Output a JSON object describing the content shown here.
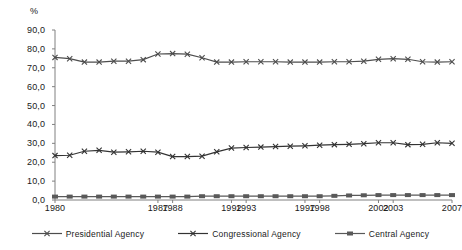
{
  "chart_data": {
    "type": "line",
    "title": "",
    "subtitle": "",
    "xlabel": "",
    "ylabel": "%",
    "ylim": [
      0,
      90
    ],
    "ytick_step": 10,
    "ytick_labels": [
      "0,0",
      "10,0",
      "20,0",
      "30,0",
      "40,0",
      "50,0",
      "60,0",
      "70,0",
      "80,0",
      "90,0"
    ],
    "ytick_values": [
      0,
      10,
      20,
      30,
      40,
      50,
      60,
      70,
      80,
      90
    ],
    "grid": false,
    "legend_position": "bottom",
    "x": [
      1980,
      1981,
      1982,
      1983,
      1984,
      1985,
      1986,
      1987,
      1988,
      1989,
      1990,
      1991,
      1992,
      1993,
      1994,
      1995,
      1996,
      1997,
      1998,
      1999,
      2000,
      2001,
      2002,
      2003,
      2004,
      2005,
      2006,
      2007
    ],
    "xtick_labels": [
      "1980",
      "1987",
      "1988",
      "1992",
      "1993",
      "1997",
      "1998",
      "2002",
      "2003",
      "2007"
    ],
    "xtick_values": [
      1980,
      1987,
      1988,
      1992,
      1993,
      1997,
      1998,
      2002,
      2003,
      2007
    ],
    "series": [
      {
        "name": "Presidential Agency",
        "marker": "x",
        "color": "#4d4d4d",
        "values": [
          75.5,
          74.8,
          73.0,
          73.0,
          73.5,
          73.5,
          74.3,
          77.3,
          77.5,
          77.2,
          75.3,
          73.0,
          73.0,
          73.2,
          73.2,
          73.2,
          73.0,
          73.0,
          73.0,
          73.2,
          73.2,
          73.5,
          74.5,
          74.8,
          74.5,
          73.2,
          73.0,
          73.2
        ]
      },
      {
        "name": "Congressional Agency",
        "marker": "x",
        "color": "#333333",
        "values": [
          23.5,
          23.7,
          25.8,
          26.3,
          25.3,
          25.5,
          25.8,
          25.3,
          23.0,
          23.0,
          23.2,
          25.5,
          27.5,
          27.8,
          28.0,
          28.3,
          28.5,
          28.7,
          29.0,
          29.3,
          29.5,
          29.8,
          30.3,
          30.3,
          29.3,
          29.5,
          30.3,
          30.0
        ]
      },
      {
        "name": "Central Agency",
        "marker": "square",
        "color": "#595959",
        "values": [
          1.8,
          1.8,
          1.8,
          1.8,
          1.8,
          1.8,
          1.8,
          1.8,
          1.8,
          1.8,
          2.0,
          2.0,
          2.0,
          2.0,
          2.0,
          2.0,
          2.0,
          2.0,
          2.0,
          2.2,
          2.4,
          2.5,
          2.6,
          2.6,
          2.6,
          2.6,
          2.6,
          2.6
        ]
      }
    ]
  },
  "axis": {
    "y_unit_label": "%"
  },
  "legend": {
    "items": [
      {
        "label": "Presidential Agency",
        "marker": "x"
      },
      {
        "label": "Congressional Agency",
        "marker": "x"
      },
      {
        "label": "Central Agency",
        "marker": "square"
      }
    ]
  }
}
